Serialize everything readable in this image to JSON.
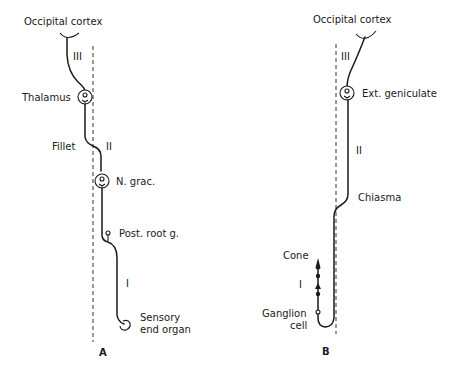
{
  "figure": {
    "panels": [
      {
        "id": "A",
        "letter": "A",
        "title": "Occipital cortex",
        "labels": {
          "thalamus": "Thalamus",
          "fillet": "Fillet",
          "neuron_ii": "II",
          "n_grac": "N. grac.",
          "post_root": "Post. root g.",
          "neuron_i": "I",
          "neuron_iii": "III",
          "sensory_line1": "Sensory",
          "sensory_line2": "end organ"
        }
      },
      {
        "id": "B",
        "letter": "B",
        "title": "Occipital cortex",
        "labels": {
          "neuron_iii": "III",
          "ext_geniculate": "Ext. geniculate",
          "neuron_ii": "II",
          "chiasma": "Chiasma",
          "cone": "Cone",
          "neuron_i": "I",
          "ganglion_line1": "Ganglion",
          "ganglion_line2": "cell"
        }
      }
    ]
  },
  "colors": {
    "ink": "#1a1a1a",
    "background": "#ffffff"
  }
}
